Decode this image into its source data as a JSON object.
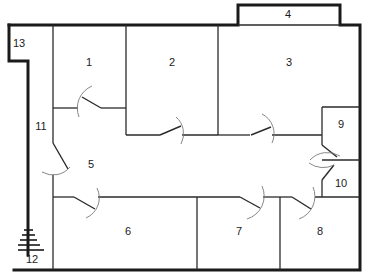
{
  "diagram": {
    "type": "floor-plan",
    "colors": {
      "walls": "#1a1a1a",
      "inner_walls": "#2a2a2a",
      "door_arcs": "#7a7a7a",
      "background": "#ffffff"
    },
    "rooms": [
      {
        "id": "1",
        "label": "1"
      },
      {
        "id": "2",
        "label": "2"
      },
      {
        "id": "3",
        "label": "3"
      },
      {
        "id": "4",
        "label": "4"
      },
      {
        "id": "5",
        "label": "5"
      },
      {
        "id": "6",
        "label": "6"
      },
      {
        "id": "7",
        "label": "7"
      },
      {
        "id": "8",
        "label": "8"
      },
      {
        "id": "9",
        "label": "9"
      },
      {
        "id": "10",
        "label": "10"
      },
      {
        "id": "11",
        "label": "11"
      },
      {
        "id": "12",
        "label": "12"
      },
      {
        "id": "13",
        "label": "13"
      }
    ]
  }
}
